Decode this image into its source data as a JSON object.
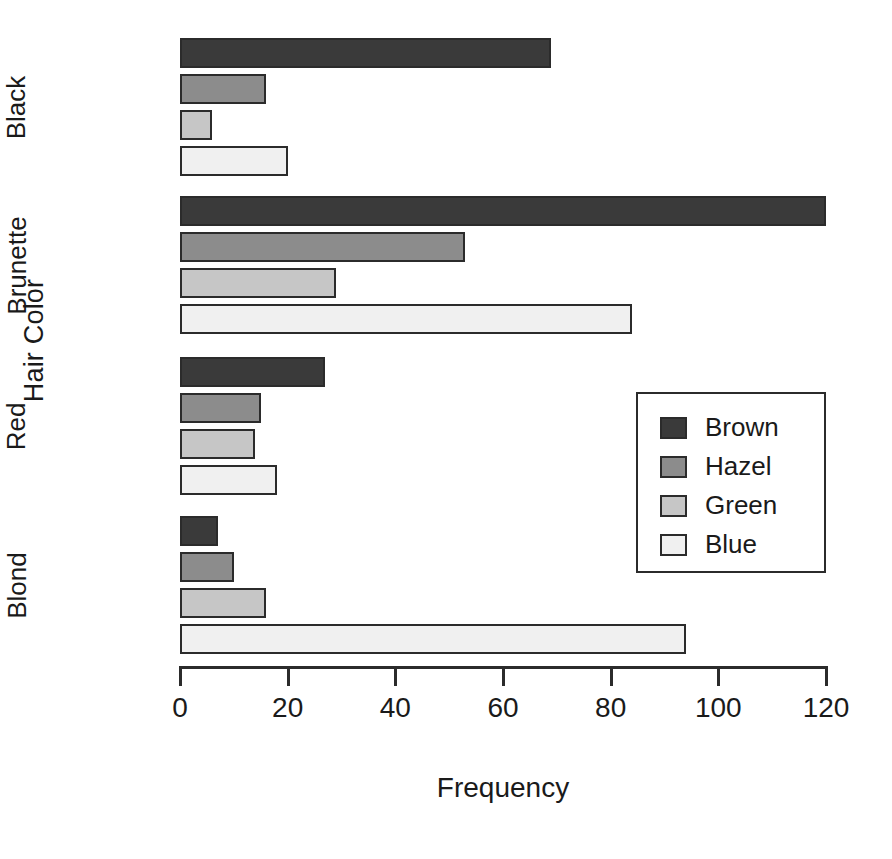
{
  "chart_data": {
    "type": "bar",
    "orientation": "horizontal",
    "title": "",
    "xlabel": "Frequency",
    "ylabel": "Hair Color",
    "categories": [
      "Black",
      "Brunette",
      "Red",
      "Blond"
    ],
    "series": [
      {
        "name": "Brown",
        "color": "#3a3a3a",
        "values": [
          69,
          120,
          27,
          7
        ]
      },
      {
        "name": "Hazel",
        "color": "#8c8c8c",
        "values": [
          16,
          53,
          15,
          10
        ]
      },
      {
        "name": "Green",
        "color": "#c6c6c6",
        "values": [
          6,
          29,
          14,
          16
        ]
      },
      {
        "name": "Blue",
        "color": "#f0f0f0",
        "values": [
          20,
          84,
          18,
          94
        ]
      }
    ],
    "xlim": [
      0,
      120
    ],
    "xticks": [
      0,
      20,
      40,
      60,
      80,
      100,
      120
    ],
    "xtick_labels": [
      "0",
      "20",
      "40",
      "60",
      "80",
      "100",
      "120"
    ],
    "grid": false,
    "legend_position": "center-right",
    "legend_entries": [
      "Brown",
      "Hazel",
      "Green",
      "Blue"
    ],
    "bar_border_color": "#2b2b2b",
    "background_color": "#ffffff"
  },
  "axes": {
    "y_title": "Hair Color",
    "x_title": "Frequency"
  },
  "legend": {
    "items": [
      {
        "label": "Brown",
        "swatch": "#3a3a3a"
      },
      {
        "label": "Hazel",
        "swatch": "#8c8c8c"
      },
      {
        "label": "Green",
        "swatch": "#c6c6c6"
      },
      {
        "label": "Blue",
        "swatch": "#f0f0f0"
      }
    ]
  }
}
